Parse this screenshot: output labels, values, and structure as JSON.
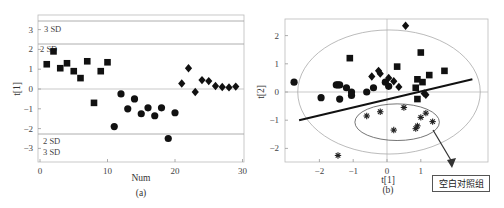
{
  "chart_data": [
    {
      "id": "a",
      "type": "scatter",
      "caption": "(a)",
      "xlabel": "Num",
      "ylabel": "t[1]",
      "xlim": [
        0,
        30
      ],
      "ylim": [
        -3.7,
        3.6
      ],
      "xticks": [
        0,
        10,
        20,
        30
      ],
      "yticks": [
        3,
        2,
        1,
        0,
        -1,
        -2,
        -3
      ],
      "reference_lines": [
        {
          "label": "3 SD",
          "y": 3.4
        },
        {
          "label": "2 SD",
          "y": 2.3
        },
        {
          "label": "2 SD",
          "y": -2.2
        },
        {
          "label": "3 SD",
          "y": -2.2
        }
      ],
      "series": [
        {
          "name": "group-square",
          "marker": "square",
          "x": [
            1,
            2,
            3,
            4,
            5,
            6,
            7,
            8,
            9,
            10
          ],
          "y": [
            1.25,
            1.9,
            1.05,
            1.3,
            0.9,
            0.55,
            1.4,
            -0.7,
            0.9,
            1.35
          ]
        },
        {
          "name": "group-circle",
          "marker": "circle",
          "x": [
            11,
            12,
            13,
            14,
            15,
            16,
            17,
            18,
            19,
            20
          ],
          "y": [
            -1.9,
            -0.25,
            -1.0,
            -0.5,
            -1.25,
            -0.95,
            -1.35,
            -0.95,
            -2.5,
            -1.2
          ]
        },
        {
          "name": "group-diamond",
          "marker": "diamond",
          "x": [
            21,
            22,
            23,
            24,
            25,
            26,
            27,
            28,
            29
          ],
          "y": [
            0.28,
            1.05,
            -0.15,
            0.45,
            0.4,
            0.15,
            0.1,
            0.08,
            0.12
          ]
        }
      ]
    },
    {
      "id": "b",
      "type": "scatter",
      "caption": "(b)",
      "xlabel": "t[1]",
      "ylabel": "t[2]",
      "xlim": [
        -3.0,
        3.0
      ],
      "ylim": [
        -2.5,
        2.5
      ],
      "xticks": [
        -2,
        -1,
        0,
        1
      ],
      "yticks": [
        2,
        1,
        0,
        -1,
        -2
      ],
      "ellipse_hotelling": {
        "cx": 0.0,
        "cy": 0.0,
        "rx": 2.7,
        "ry": 2.2
      },
      "ellipse_group": {
        "cx": 0.3,
        "cy": -1.0,
        "rx": 1.25,
        "ry": 0.65
      },
      "separating_line": {
        "x1": -2.6,
        "y1": -1.0,
        "x2": 3.0,
        "y2": 0.45
      },
      "annotation": {
        "text": "空白对照组",
        "arrow_from": [
          1.3,
          -1.3
        ],
        "arrow_to": [
          1.9,
          -2.6
        ]
      },
      "series": [
        {
          "name": "group-square",
          "marker": "square",
          "x": [
            -1.1,
            0.3,
            1.0,
            1.25,
            1.7,
            0.9,
            1.05,
            0.85,
            0.9
          ],
          "y": [
            1.2,
            0.9,
            1.4,
            0.6,
            0.75,
            0.45,
            0.35,
            0.15,
            -0.25
          ]
        },
        {
          "name": "group-circle",
          "marker": "circle",
          "x": [
            -2.75,
            -1.95,
            -1.5,
            -1.45,
            -1.4,
            -1.4,
            -1.2,
            -1.05,
            -1.05,
            -0.6,
            -0.4,
            -0.05,
            0.05
          ],
          "y": [
            0.35,
            -0.2,
            0.25,
            0.25,
            0.25,
            -0.25,
            0.15,
            0.0,
            -0.12,
            0.0,
            0.15,
            0.35,
            0.2
          ]
        },
        {
          "name": "group-diamond",
          "marker": "diamond",
          "x": [
            0.55,
            -0.25,
            -0.2,
            -0.45,
            0.05,
            0.2,
            0.35,
            1.1,
            1.15
          ],
          "y": [
            2.35,
            0.75,
            0.65,
            0.55,
            0.5,
            0.38,
            0.18,
            -0.05,
            -0.1
          ]
        },
        {
          "name": "blank-control-star",
          "marker": "star",
          "x": [
            -0.6,
            -0.2,
            0.5,
            1.15,
            1.0,
            1.35,
            0.9,
            0.85,
            0.2,
            -1.45
          ],
          "y": [
            -0.85,
            -0.7,
            -0.55,
            -0.75,
            -0.9,
            -1.05,
            -1.2,
            -1.3,
            -1.35,
            -2.25
          ]
        }
      ]
    }
  ],
  "labels": {
    "a_caption": "(a)",
    "a_xlabel": "Num",
    "a_ylabel": "t[1]",
    "b_caption": "(b)",
    "b_xlabel": "t[1]",
    "b_ylabel": "t[2]",
    "callout": "空白对照组",
    "sd_top3": "3 SD",
    "sd_top2": "2 SD",
    "sd_bot2": "2 SD",
    "sd_bot3": "3 SD"
  }
}
